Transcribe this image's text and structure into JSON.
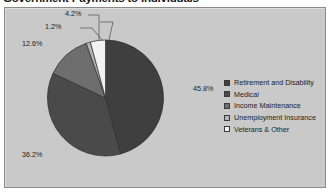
{
  "title": "Government Payments to Individuals",
  "chart_data": {
    "type": "pie",
    "title": "Government Payments to Individuals",
    "categories": [
      "Retirement and Disability",
      "Medical",
      "Income Maintenance",
      "Unemployment Insurance",
      "Veterans & Other"
    ],
    "values": [
      45.8,
      36.2,
      12.6,
      1.2,
      4.2
    ],
    "value_labels": [
      "45.8%",
      "36.2%",
      "12.6%",
      "1.2%",
      "4.2%"
    ],
    "unit": "percent",
    "slice_colors": [
      "#3f3f3f",
      "#4a4a4a",
      "#6e6e6e",
      "#b4b4b4",
      "#f2f2f2"
    ],
    "start_angle_deg": 0,
    "direction": "clockwise",
    "legend_position": "right",
    "grid": false,
    "plot_background": "#c9c9c9",
    "border_color": "#8a8a8a"
  },
  "labels": [
    {
      "text": "45.8%",
      "left": 193,
      "top": 84
    },
    {
      "text": "36.2%",
      "left": 22,
      "top": 150
    },
    {
      "text": "12.6%",
      "left": 22,
      "top": 39
    },
    {
      "text": "1.2%",
      "left": 45,
      "top": 22
    },
    {
      "text": "4.2%",
      "left": 65,
      "top": 9
    }
  ],
  "legend": {
    "items": [
      {
        "label": "Retirement and Disability",
        "color": "#3f3f3f"
      },
      {
        "label": "Medical",
        "color": "#4a4a4a"
      },
      {
        "label": "Income Maintenance",
        "color": "#6e6e6e"
      },
      {
        "label": "Unemployment Insurance",
        "color": "#b4b4b4"
      },
      {
        "label": "Veterans & Other",
        "color": "#f2f2f2"
      }
    ]
  }
}
